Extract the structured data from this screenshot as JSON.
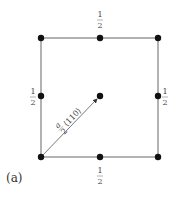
{
  "diagram": {
    "caption": "(a)",
    "vector_label": "a/2 ⟨110⟩",
    "vector_label_num": "a",
    "vector_label_den": "2",
    "vector_label_dir": "⟨110⟩",
    "fraction_num": "1",
    "fraction_den": "2",
    "atoms": [
      {
        "id": "corner-tl",
        "x": 41,
        "y": 38
      },
      {
        "id": "corner-tr",
        "x": 158,
        "y": 38
      },
      {
        "id": "corner-bl",
        "x": 41,
        "y": 157
      },
      {
        "id": "corner-br",
        "x": 158,
        "y": 157
      },
      {
        "id": "mid-top",
        "x": 100,
        "y": 38,
        "label": "1/2"
      },
      {
        "id": "mid-left",
        "x": 41,
        "y": 96,
        "label": "1/2"
      },
      {
        "id": "mid-right",
        "x": 158,
        "y": 96,
        "label": "1/2"
      },
      {
        "id": "mid-bottom",
        "x": 100,
        "y": 157,
        "label": "1/2"
      },
      {
        "id": "center",
        "x": 100,
        "y": 96
      }
    ],
    "colors": {
      "line": "#555555",
      "atom": "#111111",
      "text": "#444444"
    }
  }
}
